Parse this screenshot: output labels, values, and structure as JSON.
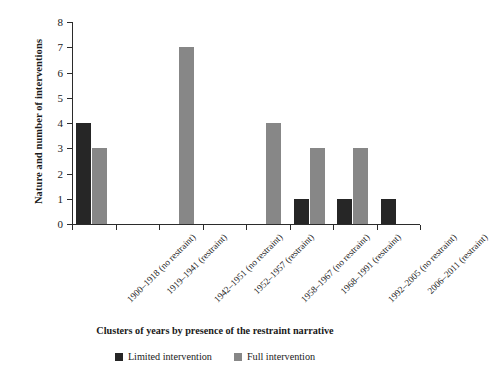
{
  "chart_data": {
    "type": "bar",
    "title": "",
    "xlabel": "Clusters of years by presence of the restraint narrative",
    "ylabel": "Nature and number of interventions",
    "ylim": [
      0,
      8
    ],
    "yticks": [
      0,
      1,
      2,
      3,
      4,
      5,
      6,
      7,
      8
    ],
    "grid": false,
    "legend_position": "bottom-center",
    "categories": [
      "1900–1918 (no restraint)",
      "1919–1941 (restraint)",
      "1942–1951 (no restraint)",
      "1952–1957 (restraint)",
      "1958–1967 (no restraint)",
      "1968–1991 (restraint)",
      "1992–2005 (no restraint)",
      "2006–2011 (restraint)"
    ],
    "series": [
      {
        "name": "Limited intervention",
        "color": "#262626",
        "values": [
          4,
          0,
          0,
          0,
          0,
          1,
          1,
          1
        ]
      },
      {
        "name": "Full intervention",
        "color": "#878787",
        "values": [
          3,
          0,
          7,
          0,
          4,
          3,
          3,
          0
        ]
      }
    ]
  },
  "colors": {
    "limited": "#262626",
    "full": "#878787",
    "axis": "#2b2b2b",
    "background": "#ffffff"
  }
}
